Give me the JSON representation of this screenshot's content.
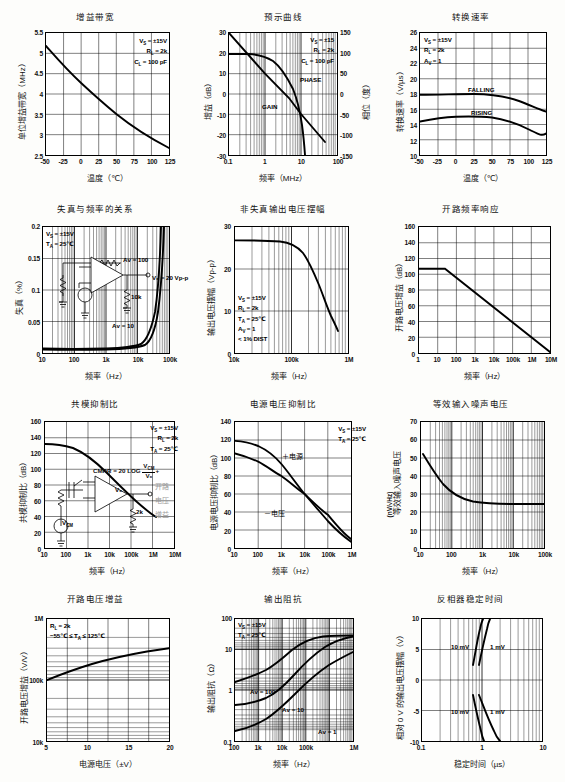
{
  "page": {
    "header_partial": ""
  },
  "chart_data": [
    {
      "id": "gain-bandwidth",
      "type": "line",
      "title": "增益带宽",
      "xlabel": "温度（℃）",
      "ylabel": "单位增益带宽（MHz）",
      "xticks": [
        "-50",
        "-25",
        "0",
        "25",
        "50",
        "75",
        "100",
        "125"
      ],
      "yticks": [
        "5.5",
        "5",
        "4.5",
        "4",
        "3.5",
        "3",
        "2.5"
      ],
      "xlim": [
        -50,
        125
      ],
      "ylim": [
        2.5,
        5.5
      ],
      "grid": true,
      "conditions": [
        "V<sub>S</sub> = ±15V",
        "R<sub>L</sub> = 2k",
        "C<sub>L</sub> = 100 pF"
      ],
      "series": [
        {
          "name": "unity gain bandwidth",
          "x": [
            -50,
            -25,
            0,
            25,
            50,
            75,
            100,
            125
          ],
          "values": [
            5.18,
            4.73,
            4.33,
            4.0,
            3.69,
            3.4,
            3.15,
            2.92
          ]
        }
      ]
    },
    {
      "id": "bode-plot",
      "type": "line",
      "title": "预示曲线",
      "xlabel": "频率（MHz）",
      "ylabel": "增益（dB）",
      "ylabel_right": "相位（度）",
      "xticks": [
        "0.1",
        "1",
        "10",
        "100"
      ],
      "yticks": [
        "30",
        "20",
        "10",
        "0",
        "-10",
        "-20",
        "-30"
      ],
      "yticks_right": [
        "150",
        "100",
        "50",
        "0",
        "-50",
        "-100",
        "-150"
      ],
      "xlim": [
        0.1,
        100
      ],
      "ylim": [
        -30,
        30
      ],
      "ylim_right": [
        -150,
        150
      ],
      "xscale": "log",
      "grid": true,
      "conditions": [
        "V<sub>S</sub> = ±15",
        "R<sub>L</sub> = 2k",
        "C<sub>L</sub> = 100 pF"
      ],
      "annotations": [
        "GAIN",
        "PHASE"
      ],
      "series": [
        {
          "name": "GAIN",
          "x": [
            0.1,
            0.2,
            0.5,
            1,
            2,
            4,
            7,
            10,
            15,
            20,
            30
          ],
          "values": [
            30,
            24,
            16,
            10,
            4,
            -2,
            -7.5,
            -10.5,
            -15,
            -18,
            -22
          ]
        },
        {
          "name": "PHASE",
          "x": [
            0.1,
            0.3,
            0.6,
            1,
            2,
            4,
            7,
            10,
            14,
            18,
            22,
            25
          ],
          "values": [
            19.5,
            19.5,
            19,
            18,
            15,
            9,
            2,
            -3,
            -10,
            -16,
            -24,
            -30
          ]
        }
      ]
    },
    {
      "id": "slew-rate",
      "type": "line",
      "title": "转换速率",
      "xlabel": "温度（℃）",
      "ylabel": "转换速率（V/µs）",
      "xticks": [
        "-50",
        "-25",
        "0",
        "25",
        "50",
        "75",
        "100",
        "125"
      ],
      "yticks": [
        "26",
        "24",
        "22",
        "20",
        "18",
        "16",
        "14",
        "12",
        "10"
      ],
      "xlim": [
        -50,
        125
      ],
      "ylim": [
        10,
        26
      ],
      "grid": true,
      "conditions": [
        "V<sub>S</sub> = ±15V",
        "R<sub>L</sub> = 2k",
        "A<sub>V</sub> = 1"
      ],
      "series": [
        {
          "name": "FALLING",
          "x": [
            -50,
            -25,
            0,
            25,
            50,
            75,
            100,
            125
          ],
          "values": [
            17.9,
            17.9,
            18.0,
            18.0,
            17.9,
            17.5,
            16.9,
            15.7
          ]
        },
        {
          "name": "RISING",
          "x": [
            -50,
            -25,
            0,
            25,
            50,
            75,
            100,
            125
          ],
          "values": [
            14.4,
            14.8,
            15.0,
            15.1,
            15.0,
            14.7,
            14.0,
            12.8
          ]
        }
      ]
    },
    {
      "id": "distortion-vs-frequency",
      "type": "line",
      "title": "失真与频率的关系",
      "xlabel": "频率（Hz）",
      "ylabel": "失真（%）",
      "xticks": [
        "10",
        "100",
        "1k",
        "10k",
        "100k"
      ],
      "yticks": [
        "0.2",
        "0.15",
        "0.1",
        "0.05",
        "0"
      ],
      "xlim": [
        10,
        100000
      ],
      "ylim": [
        0,
        0.2
      ],
      "xscale": "log",
      "grid": true,
      "conditions": [
        "V<sub>S</sub> = ±15V",
        "T<sub>A</sub> = 25℃"
      ],
      "annotations": [
        "Aᴠ = 100",
        "Aᴠ = 10",
        "V₀ = 20 Vp-p",
        "10k"
      ],
      "series": [
        {
          "name": "Aᴠ = 100",
          "x": [
            10,
            100,
            1000,
            10000,
            30000,
            50000,
            70000,
            100000
          ],
          "values": [
            0.007,
            0.006,
            0.006,
            0.007,
            0.012,
            0.035,
            0.11,
            0.2
          ]
        },
        {
          "name": "Aᴠ = 10",
          "x": [
            10,
            100,
            1000,
            10000,
            30000,
            50000,
            80000,
            100000
          ],
          "values": [
            0.006,
            0.005,
            0.005,
            0.006,
            0.009,
            0.022,
            0.1,
            0.2
          ]
        }
      ]
    },
    {
      "id": "undistorted-output-swing",
      "type": "line",
      "title": "非失真输出电压摆幅",
      "xlabel": "频率（Hz）",
      "ylabel": "输出电压摆幅（Vp-p）",
      "xticks": [
        "10k",
        "100k",
        "1M"
      ],
      "yticks": [
        "30",
        "20",
        "10",
        "0"
      ],
      "xlim": [
        10000,
        1000000
      ],
      "ylim": [
        0,
        30
      ],
      "xscale": "log",
      "grid": true,
      "conditions": [
        "V<sub>S</sub> = ±15V",
        "R<sub>L</sub> = 2k",
        "T<sub>A</sub> = 25℃",
        "A<sub>V</sub> = 1",
        "< 1% DIST"
      ],
      "series": [
        {
          "name": "output swing",
          "x": [
            10000,
            30000,
            60000,
            100000,
            200000,
            300000,
            450000,
            600000,
            700000
          ],
          "values": [
            27,
            27,
            27,
            26,
            23,
            20.5,
            15,
            10.5,
            8.8
          ]
        }
      ]
    },
    {
      "id": "open-loop-frequency-response",
      "type": "line",
      "title": "开路频率响应",
      "xlabel": "频率（Hz）",
      "ylabel": "开路电压增益（dB）",
      "xticks": [
        "1",
        "10",
        "100",
        "1k",
        "10k",
        "100k",
        "1M",
        "10M"
      ],
      "yticks": [
        "160",
        "140",
        "120",
        "100",
        "80",
        "60",
        "40",
        "20",
        "0"
      ],
      "xlim": [
        1,
        10000000
      ],
      "ylim": [
        0,
        160
      ],
      "xscale": "log",
      "grid": true,
      "series": [
        {
          "name": "open loop gain",
          "x": [
            1,
            10,
            25,
            10000000
          ],
          "values": [
            107,
            107,
            107,
            1
          ]
        }
      ]
    },
    {
      "id": "cmrr",
      "type": "line",
      "title": "共模抑制比",
      "xlabel": "频率（Hz）",
      "ylabel": "共模抑制比（dB）",
      "xticks": [
        "10",
        "100",
        "1k",
        "10k",
        "100k",
        "1M",
        "10M"
      ],
      "yticks": [
        "160",
        "140",
        "120",
        "100",
        "80",
        "60",
        "40",
        "20",
        "0"
      ],
      "xlim": [
        10,
        10000000
      ],
      "ylim": [
        0,
        160
      ],
      "xscale": "log",
      "grid": true,
      "conditions": [
        "V<sub>S</sub> = ±15V",
        "R<sub>L</sub> = 2k",
        "T<sub>A</sub> = 25℃"
      ],
      "formula": "CMRR = 20 LOG",
      "formula_num": "V<sub>CM</sub>",
      "formula_den": "V₀",
      "formula_tail": "+",
      "side_text": [
        "开路",
        "电压",
        "增益"
      ],
      "schematic_labels": [
        "V₀",
        "V",
        "2k"
      ],
      "series": [
        {
          "name": "CMRR",
          "x": [
            10,
            100,
            1000,
            5000,
            20000,
            100000,
            300000,
            1000000
          ],
          "values": [
            112,
            111,
            106,
            98,
            86,
            70,
            60,
            49
          ]
        }
      ]
    },
    {
      "id": "psrr",
      "type": "line",
      "title": "电源电压抑制比",
      "xlabel": "频率（Hz）",
      "ylabel": "电源电压抑制比（dB）",
      "xticks": [
        "10",
        "100",
        "1k",
        "10k",
        "100k",
        "1M"
      ],
      "yticks": [
        "140",
        "120",
        "100",
        "80",
        "60",
        "40",
        "20",
        "0"
      ],
      "xlim": [
        10,
        1000000
      ],
      "ylim": [
        0,
        140
      ],
      "xscale": "log",
      "grid": true,
      "conditions": [
        "V<sub>S</sub> = ±15V",
        "T<sub>A</sub> = 25℃"
      ],
      "annotations": [
        "＋电源",
        "－电压"
      ],
      "series": [
        {
          "name": "+电源",
          "x": [
            10,
            100,
            1000,
            10000,
            100000,
            1000000
          ],
          "values": [
            119,
            115,
            100,
            80,
            58,
            36
          ]
        },
        {
          "name": "-电压",
          "x": [
            10,
            100,
            1000,
            10000,
            100000,
            1000000
          ],
          "values": [
            105,
            96,
            80,
            60,
            37,
            10
          ]
        }
      ]
    },
    {
      "id": "input-noise-voltage",
      "type": "line",
      "title": "等效输入噪声电压",
      "xlabel": "频率（Hz）",
      "ylabel": "等效输入噪声电压",
      "ylabel_unit": "(nV/√Hz)",
      "xticks": [
        "10",
        "100",
        "1k",
        "10k",
        "100k"
      ],
      "yticks": [
        "70",
        "60",
        "50",
        "40",
        "30",
        "20",
        "10",
        "0"
      ],
      "xlim": [
        10,
        100000
      ],
      "ylim": [
        0,
        70
      ],
      "xscale": "log",
      "grid": true,
      "series": [
        {
          "name": "noise voltage",
          "x": [
            11,
            15,
            20,
            30,
            50,
            70,
            100,
            200,
            500,
            1000,
            10000,
            100000
          ],
          "values": [
            52,
            45,
            40,
            34,
            30,
            28.5,
            27.5,
            26,
            25.5,
            25.5,
            25.5,
            25.5
          ]
        }
      ]
    },
    {
      "id": "open-loop-voltage-gain",
      "type": "line",
      "title": "开路电压增益",
      "xlabel": "电源电压（±V）",
      "ylabel": "开路电压增益（V/V）",
      "xticks": [
        "5",
        "10",
        "15",
        "20"
      ],
      "yticks": [
        "1M",
        "100k",
        "10k"
      ],
      "xlim": [
        5,
        20
      ],
      "ylim": [
        10000,
        1000000
      ],
      "yscale": "log",
      "grid": true,
      "conditions": [
        "R<sub>L</sub> = 2k",
        "−55℃ ≤ T<sub>A</sub> ≤ 125℃"
      ],
      "series": [
        {
          "name": "open loop gain",
          "x": [
            5,
            7.5,
            10,
            12.5,
            15,
            17.5,
            20
          ],
          "values": [
            100000,
            140000,
            185000,
            230000,
            280000,
            330000,
            380000
          ]
        }
      ]
    },
    {
      "id": "output-impedance",
      "type": "line",
      "title": "输出阻抗",
      "xlabel": "频率（Hz）",
      "ylabel": "输出阻抗（Ω）",
      "xticks": [
        "100",
        "1k",
        "10k",
        "100k",
        "1M"
      ],
      "yticks": [
        "100",
        "10",
        "1",
        "0.1"
      ],
      "xlim": [
        100,
        1000000
      ],
      "ylim": [
        0.1,
        100
      ],
      "xscale": "log",
      "yscale": "log",
      "grid": true,
      "conditions": [
        "V<sub>S</sub> = ±15V",
        "T<sub>A</sub> = 25℃"
      ],
      "annotations": [
        "Aᴠ = 100",
        "Aᴠ = 10",
        "Aᴠ = 1"
      ],
      "series": [
        {
          "name": "Aᴠ = 100",
          "x": [
            100,
            300,
            1000,
            3000,
            10000,
            30000,
            100000,
            300000,
            1000000
          ],
          "values": [
            1.6,
            2.2,
            3.4,
            6,
            13,
            27,
            40,
            42,
            42
          ]
        },
        {
          "name": "Aᴠ = 10",
          "x": [
            100,
            300,
            1000,
            3000,
            10000,
            30000,
            100000,
            300000,
            1000000
          ],
          "values": [
            0.42,
            0.45,
            0.6,
            1.0,
            2.3,
            6,
            20,
            36,
            40
          ]
        },
        {
          "name": "Aᴠ = 1",
          "x": [
            100,
            300,
            1000,
            3000,
            10000,
            30000,
            100000,
            300000,
            1000000
          ],
          "values": [
            0.1,
            0.12,
            0.18,
            0.33,
            0.62,
            1.1,
            2.4,
            5,
            11
          ]
        }
      ]
    },
    {
      "id": "inverter-settling-time",
      "type": "line",
      "title": "反相器稳定时间",
      "xlabel": "稳定时间（µs）",
      "ylabel": "相对 0 V 的输出电压摆幅（V）",
      "xticks": [
        "0.1",
        "1",
        "10"
      ],
      "yticks": [
        "10",
        "5",
        "0",
        "-5",
        "-10"
      ],
      "xlim": [
        0.1,
        10
      ],
      "ylim": [
        -10,
        10
      ],
      "xscale": "log",
      "grid": true,
      "annotations": [
        "10 mV",
        "1 mV",
        "10 mV",
        "1 mV"
      ],
      "series": [
        {
          "name": "upper 10 mV",
          "x": [
            0.62,
            0.7,
            0.8,
            0.92
          ],
          "values": [
            2.6,
            5.5,
            8.2,
            10
          ]
        },
        {
          "name": "upper 1 mV",
          "x": [
            0.72,
            0.82,
            0.94,
            1.05
          ],
          "values": [
            2.6,
            5.5,
            8.2,
            10
          ]
        },
        {
          "name": "lower 10 mV",
          "x": [
            0.62,
            0.72,
            0.85,
            1.0
          ],
          "values": [
            -2.6,
            -5.2,
            -8.0,
            -10
          ]
        },
        {
          "name": "lower 1 mV",
          "x": [
            0.75,
            0.95,
            1.25,
            1.6
          ],
          "values": [
            -2.6,
            -5.2,
            -8.0,
            -10
          ]
        }
      ]
    }
  ]
}
